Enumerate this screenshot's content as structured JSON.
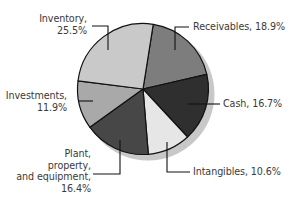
{
  "chart_data": {
    "type": "pie",
    "title": "",
    "start_angle_deg_clockwise_from_top": 9,
    "direction": "clockwise",
    "slices": [
      {
        "label": "Receivables",
        "value": 18.9,
        "display": "Receivables, 18.9%",
        "color": "#7d7d7d"
      },
      {
        "label": "Cash",
        "value": 16.7,
        "display": "Cash, 16.7%",
        "color": "#2f2f2f"
      },
      {
        "label": "Intangibles",
        "value": 10.6,
        "display": "Intangibles, 10.6%",
        "color": "#e6e6e6"
      },
      {
        "label": "Plant, property, and equipment",
        "value": 16.4,
        "display": "Plant, property, and equipment, 16.4%",
        "color": "#474747"
      },
      {
        "label": "Investments",
        "value": 11.9,
        "display": "Investments, 11.9%",
        "color": "#a9a9a9"
      },
      {
        "label": "Inventory",
        "value": 25.5,
        "display": "Inventory, 25.5%",
        "color": "#c9c9c9"
      }
    ],
    "labels": {
      "inventory": [
        "Inventory,",
        "25.5%"
      ],
      "receivables": [
        "Receivables, 18.9%"
      ],
      "investments": [
        "Investments,",
        "11.9%"
      ],
      "cash": [
        "Cash, 16.7%"
      ],
      "plant": [
        "Plant,",
        "property,",
        "and equipment,",
        "16.4%"
      ],
      "intangibles": [
        "Intangibles, 10.6%"
      ]
    },
    "legend": "none (callout labels)",
    "shadow_color": "#c8c8c8",
    "outline_color": "#111111"
  }
}
